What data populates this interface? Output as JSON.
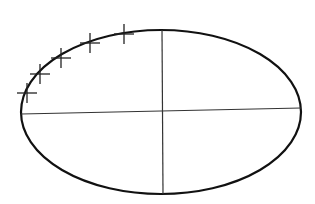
{
  "diagram": {
    "type": "ellipse-with-axes",
    "background": "#ffffff",
    "stroke_color": "#111111",
    "ellipse": {
      "cx": 161,
      "cy": 112,
      "rx": 140,
      "ry": 82,
      "stroke_width": 2.2
    },
    "axes": {
      "horizontal": {
        "x1": 21,
        "y1": 114,
        "x2": 301,
        "y2": 108,
        "stroke_width": 1.2
      },
      "vertical": {
        "x1": 162,
        "y1": 30,
        "x2": 163,
        "y2": 194,
        "stroke_width": 1.2
      }
    },
    "tick_marks": [
      {
        "x": 27,
        "y": 93,
        "angle": -70
      },
      {
        "x": 40,
        "y": 74,
        "angle": -55
      },
      {
        "x": 61,
        "y": 58,
        "angle": -40
      },
      {
        "x": 90,
        "y": 43,
        "angle": -25
      },
      {
        "x": 124,
        "y": 34,
        "angle": -10
      }
    ],
    "tick_size": 10
  }
}
